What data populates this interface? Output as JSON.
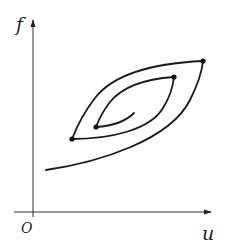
{
  "diagram": {
    "type": "hysteresis-loop",
    "axes": {
      "x_label": "u",
      "y_label": "f",
      "origin_label": "O"
    },
    "colors": {
      "line": "#1a1a1a",
      "axis": "#333333",
      "background": "#ffffff"
    },
    "points": [
      {
        "name": "outer-turning-point",
        "x": 203,
        "y": 61
      },
      {
        "name": "left-turning-point",
        "x": 72,
        "y": 139
      },
      {
        "name": "inner-turning-point",
        "x": 174,
        "y": 77
      },
      {
        "name": "innermost-turning-point",
        "x": 96,
        "y": 127
      }
    ]
  }
}
